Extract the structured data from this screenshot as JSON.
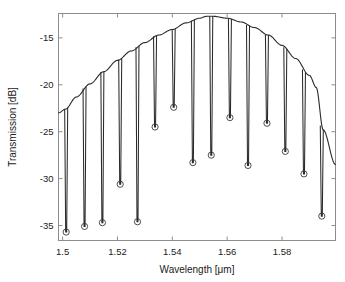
{
  "chart_data": {
    "type": "line",
    "title": "",
    "xlabel": "Wavelength [μm]",
    "ylabel": "Transmission [dB]",
    "xlim": [
      1.4985,
      1.5995
    ],
    "ylim": [
      -36.6,
      -12.4
    ],
    "xticks": [
      1.5,
      1.52,
      1.54,
      1.56,
      1.58
    ],
    "xtick_labels": [
      "1.5",
      "1.52",
      "1.54",
      "1.56",
      "1.58"
    ],
    "yticks": [
      -15,
      -20,
      -25,
      -30,
      -35
    ],
    "ytick_labels": [
      "-15",
      "-20",
      "-25",
      "-30",
      "-35"
    ],
    "grid": false,
    "legend": "none",
    "series": [
      {
        "name": "envelope",
        "description": "Smooth parabolic-like transmission envelope peaking near 1.5525 um at about -12.7 dB",
        "x": [
          1.4985,
          1.501,
          1.505,
          1.51,
          1.515,
          1.52,
          1.525,
          1.53,
          1.535,
          1.54,
          1.545,
          1.55,
          1.5525,
          1.555,
          1.56,
          1.565,
          1.57,
          1.575,
          1.58,
          1.585,
          1.59,
          1.5925,
          1.595,
          1.5995
        ],
        "y": [
          -23.0,
          -22.6,
          -21.3,
          -19.9,
          -18.6,
          -17.4,
          -16.4,
          -15.5,
          -14.7,
          -14.1,
          -13.4,
          -12.9,
          -12.7,
          -12.7,
          -12.9,
          -13.3,
          -13.9,
          -14.7,
          -15.8,
          -17.2,
          -19.0,
          -20.3,
          -24.8,
          -28.5
        ]
      },
      {
        "name": "resonance_notches",
        "description": "Downward narrow notch dips from the envelope; circle markers mark each notch minimum",
        "x": [
          1.5013,
          1.508,
          1.5145,
          1.521,
          1.5273,
          1.5337,
          1.5405,
          1.5475,
          1.5542,
          1.561,
          1.5676,
          1.5745,
          1.5812,
          1.588,
          1.5945
        ],
        "y": [
          -35.7,
          -35.1,
          -34.7,
          -30.6,
          -34.6,
          -24.5,
          -22.4,
          -28.3,
          -27.5,
          -23.5,
          -28.6,
          -24.1,
          -27.1,
          -29.5,
          -34.0
        ]
      }
    ]
  },
  "axes": {
    "xlabel": "Wavelength [μm]",
    "ylabel": "Transmission [dB]"
  }
}
